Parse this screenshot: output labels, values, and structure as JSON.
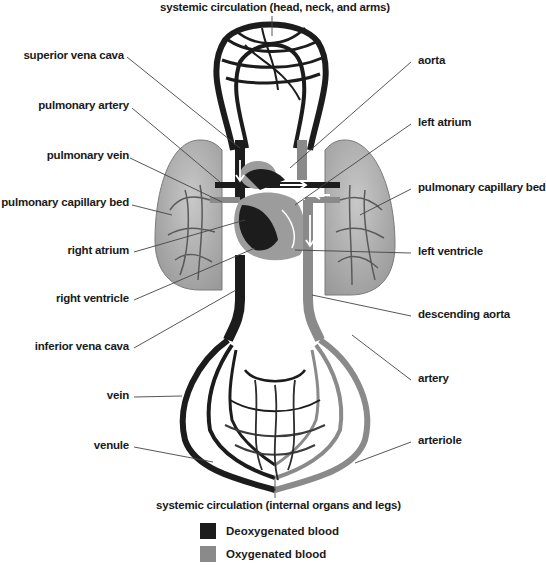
{
  "title_top": "systemic circulation (head, neck, and arms)",
  "title_bottom": "systemic circulation (internal organs and legs)",
  "labels_left": [
    {
      "text": "superior vena cava",
      "y": 55
    },
    {
      "text": "pulmonary artery",
      "y": 106
    },
    {
      "text": "pulmonary vein",
      "y": 155
    },
    {
      "text": "pulmonary capillary bed",
      "y": 202
    },
    {
      "text": "right atrium",
      "y": 250
    },
    {
      "text": "right ventricle",
      "y": 298
    },
    {
      "text": "inferior vena cava",
      "y": 346
    },
    {
      "text": "vein",
      "y": 395
    },
    {
      "text": "venule",
      "y": 445
    }
  ],
  "labels_right": [
    {
      "text": "aorta",
      "y": 60
    },
    {
      "text": "left atrium",
      "y": 122
    },
    {
      "text": "pulmonary capillary bed",
      "y": 187
    },
    {
      "text": "left ventricle",
      "y": 251
    },
    {
      "text": "descending aorta",
      "y": 314
    },
    {
      "text": "artery",
      "y": 378
    },
    {
      "text": "arteriole",
      "y": 440
    }
  ],
  "legend": [
    {
      "label": "Deoxygenated blood",
      "color": "#1c1c1c"
    },
    {
      "label": "Oxygenated blood",
      "color": "#8a8a8a"
    }
  ],
  "colors": {
    "deoxygenated": "#1c1c1c",
    "oxygenated": "#8a8a8a",
    "lung": "#b5b5b5",
    "heart_light": "#9c9c9c"
  }
}
